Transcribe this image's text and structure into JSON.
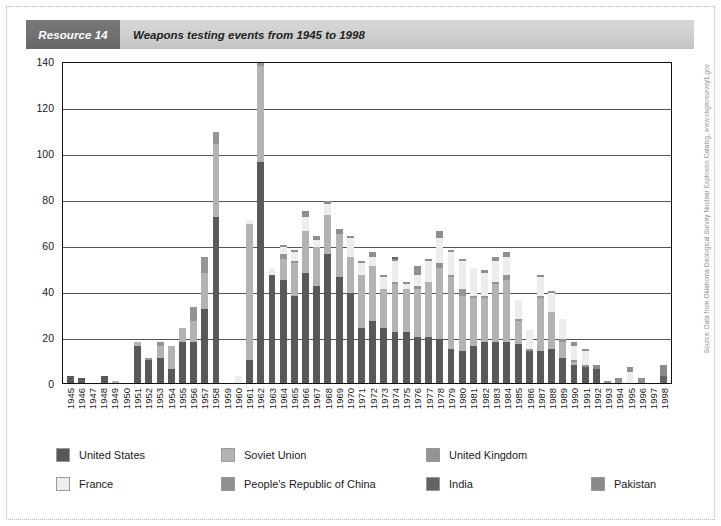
{
  "header": {
    "resource_tag": "Resource 14",
    "title": "Weapons testing events from 1945 to 1998"
  },
  "source_note": "Source: Data from Oklahoma Geological Survey Nuclear Explosion Catalog, www.okgeosurvey1.gov",
  "legend": {
    "items": [
      {
        "label": "United States",
        "color": "#595959"
      },
      {
        "label": "Soviet Union",
        "color": "#b3b3b3"
      },
      {
        "label": "United Kingdom",
        "color": "#949494"
      },
      {
        "label": "France",
        "color": "#ededed"
      },
      {
        "label": "People's Republic of China",
        "color": "#8f8f8f"
      },
      {
        "label": "India",
        "color": "#636363"
      },
      {
        "label": "Pakistan",
        "color": "#8a8a8a"
      }
    ]
  },
  "chart_data": {
    "type": "bar",
    "stacked": true,
    "title": "Weapons testing events from 1945 to 1998",
    "xlabel": "",
    "ylabel": "",
    "ylim": [
      0,
      140
    ],
    "yticks": [
      0,
      20,
      40,
      60,
      80,
      100,
      120,
      140
    ],
    "grid": true,
    "legend_position": "bottom",
    "categories": [
      "1945",
      "1946",
      "1947",
      "1948",
      "1949",
      "1950",
      "1951",
      "1952",
      "1953",
      "1954",
      "1955",
      "1956",
      "1957",
      "1958",
      "1959",
      "1960",
      "1961",
      "1962",
      "1963",
      "1964",
      "1965",
      "1966",
      "1967",
      "1968",
      "1969",
      "1970",
      "1971",
      "1972",
      "1973",
      "1974",
      "1975",
      "1976",
      "1977",
      "1978",
      "1979",
      "1980",
      "1981",
      "1982",
      "1983",
      "1984",
      "1985",
      "1986",
      "1987",
      "1988",
      "1989",
      "1990",
      "1991",
      "1992",
      "1993",
      "1994",
      "1995",
      "1996",
      "1997",
      "1998"
    ],
    "series": [
      {
        "name": "United States",
        "color": "#595959",
        "values": [
          3,
          2,
          0,
          3,
          0,
          0,
          16,
          10,
          11,
          6,
          18,
          18,
          32,
          72,
          0,
          0,
          10,
          96,
          47,
          45,
          38,
          48,
          42,
          56,
          46,
          39,
          24,
          27,
          24,
          22,
          22,
          20,
          20,
          19,
          15,
          14,
          16,
          18,
          18,
          18,
          17,
          14,
          14,
          15,
          11,
          8,
          7,
          6,
          0,
          0,
          0,
          0,
          0,
          0
        ]
      },
      {
        "name": "Soviet Union",
        "color": "#b3b3b3",
        "values": [
          0,
          0,
          0,
          0,
          1,
          0,
          2,
          0,
          5,
          10,
          6,
          9,
          16,
          32,
          0,
          0,
          59,
          42,
          0,
          9,
          14,
          18,
          17,
          17,
          19,
          16,
          23,
          24,
          17,
          21,
          19,
          21,
          24,
          31,
          31,
          24,
          21,
          19,
          25,
          27,
          10,
          0,
          23,
          16,
          7,
          1,
          0,
          0,
          0,
          0,
          0,
          0,
          0,
          0
        ]
      },
      {
        "name": "United Kingdom",
        "color": "#949494",
        "values": [
          0,
          0,
          0,
          0,
          0,
          0,
          0,
          1,
          2,
          0,
          0,
          6,
          7,
          5,
          0,
          0,
          0,
          2,
          0,
          2,
          1,
          0,
          0,
          0,
          0,
          0,
          0,
          0,
          0,
          1,
          0,
          1,
          0,
          2,
          1,
          3,
          1,
          1,
          1,
          2,
          1,
          1,
          1,
          0,
          1,
          1,
          1,
          0,
          0,
          0,
          0,
          0,
          0,
          0
        ]
      },
      {
        "name": "France",
        "color": "#ededed",
        "values": [
          0,
          0,
          0,
          0,
          0,
          0,
          0,
          0,
          0,
          0,
          0,
          0,
          0,
          0,
          0,
          3,
          2,
          1,
          3,
          3,
          4,
          6,
          3,
          5,
          0,
          8,
          5,
          4,
          5,
          9,
          2,
          5,
          9,
          11,
          10,
          12,
          12,
          10,
          9,
          8,
          8,
          8,
          8,
          8,
          9,
          6,
          6,
          0,
          0,
          0,
          5,
          0,
          0,
          0
        ]
      },
      {
        "name": "People's Republic of China",
        "color": "#8f8f8f",
        "values": [
          0,
          0,
          0,
          0,
          0,
          0,
          0,
          0,
          0,
          0,
          0,
          0,
          0,
          0,
          0,
          0,
          0,
          0,
          0,
          1,
          1,
          3,
          2,
          1,
          2,
          1,
          1,
          2,
          1,
          1,
          1,
          4,
          1,
          3,
          1,
          1,
          0,
          1,
          2,
          2,
          0,
          0,
          1,
          1,
          0,
          2,
          1,
          2,
          1,
          2,
          2,
          2,
          0,
          0
        ]
      },
      {
        "name": "India",
        "color": "#636363",
        "values": [
          0,
          0,
          0,
          0,
          0,
          0,
          0,
          0,
          0,
          0,
          0,
          0,
          0,
          0,
          0,
          0,
          0,
          0,
          0,
          0,
          0,
          0,
          0,
          0,
          0,
          0,
          0,
          0,
          0,
          1,
          0,
          0,
          0,
          0,
          0,
          0,
          0,
          0,
          0,
          0,
          0,
          0,
          0,
          0,
          0,
          0,
          0,
          0,
          0,
          0,
          0,
          0,
          0,
          3
        ]
      },
      {
        "name": "Pakistan",
        "color": "#8a8a8a",
        "values": [
          0,
          0,
          0,
          0,
          0,
          0,
          0,
          0,
          0,
          0,
          0,
          0,
          0,
          0,
          0,
          0,
          0,
          0,
          0,
          0,
          0,
          0,
          0,
          0,
          0,
          0,
          0,
          0,
          0,
          0,
          0,
          0,
          0,
          0,
          0,
          0,
          0,
          0,
          0,
          0,
          0,
          0,
          0,
          0,
          0,
          0,
          0,
          0,
          0,
          0,
          0,
          0,
          0,
          5
        ]
      }
    ]
  }
}
